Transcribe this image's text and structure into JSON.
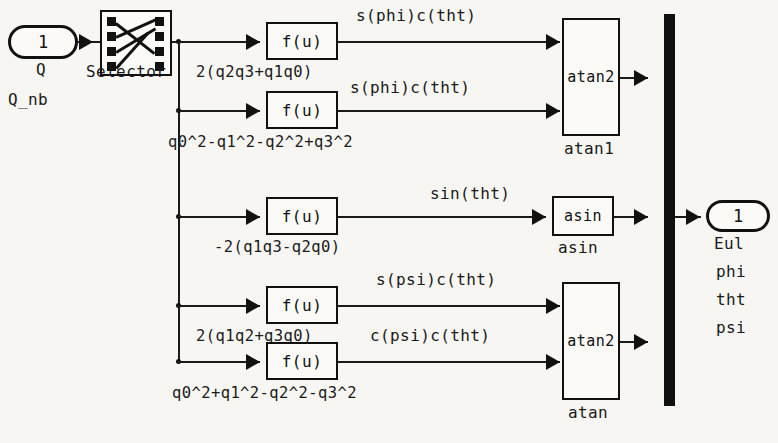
{
  "diagram": {
    "input_port": {
      "number": "1",
      "name": "Q",
      "sublabel": "Q_nb"
    },
    "selector": {
      "label": "Selector",
      "icon": "selector-crossbar-icon"
    },
    "fu_blocks": [
      {
        "text": "f(u)",
        "expression": "2(q2q3+q1q0)",
        "signal": "s(phi)c(tht)"
      },
      {
        "text": "f(u)",
        "expression": "q0^2-q1^2-q2^2+q3^2",
        "signal": "s(phi)c(tht)"
      },
      {
        "text": "f(u)",
        "expression": "-2(q1q3-q2q0)",
        "signal": "sin(tht)"
      },
      {
        "text": "f(u)",
        "expression": "2(q1q2+q3q0)",
        "signal": "s(psi)c(tht)"
      },
      {
        "text": "f(u)",
        "expression": "q0^2+q1^2-q2^2-q3^2",
        "signal": "c(psi)c(tht)"
      }
    ],
    "trig_blocks": [
      {
        "text": "atan2",
        "label": "atan1"
      },
      {
        "text": "asin",
        "label": "asin"
      },
      {
        "text": "atan2",
        "label": "atan"
      }
    ],
    "mux": {
      "icon": "mux-bar-icon"
    },
    "output_port": {
      "number": "1",
      "name": "Eul",
      "components": [
        "phi",
        "tht",
        "psi"
      ]
    },
    "colors": {
      "background": "#f7f6f2",
      "line": "#1a1a1a",
      "block_fill": "#fbfaf7"
    }
  }
}
